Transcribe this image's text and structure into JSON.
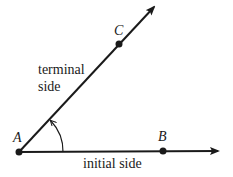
{
  "diagram": {
    "title": "",
    "points": [
      {
        "id": "A",
        "label": "A",
        "x": 19,
        "y": 152
      },
      {
        "id": "B",
        "label": "B",
        "x": 163,
        "y": 151
      },
      {
        "id": "C",
        "label": "C",
        "x": 119,
        "y": 44
      }
    ],
    "rays": [
      {
        "id": "initial",
        "from": "A",
        "to_x": 220,
        "to_y": 151,
        "label": "initial side"
      },
      {
        "id": "terminal",
        "from": "A",
        "to_x": 156,
        "to_y": 5,
        "label": "terminal\nside"
      }
    ],
    "labels": {
      "A": "A",
      "B": "B",
      "C": "C",
      "terminal_line1": "terminal",
      "terminal_line2": "side",
      "initial": "initial side"
    },
    "angle_arc": {
      "center": "A",
      "radius": 44,
      "direction": "counterclockwise",
      "arrow": true
    },
    "colors": {
      "stroke": "#1a1a1a",
      "background": "#ffffff"
    }
  }
}
